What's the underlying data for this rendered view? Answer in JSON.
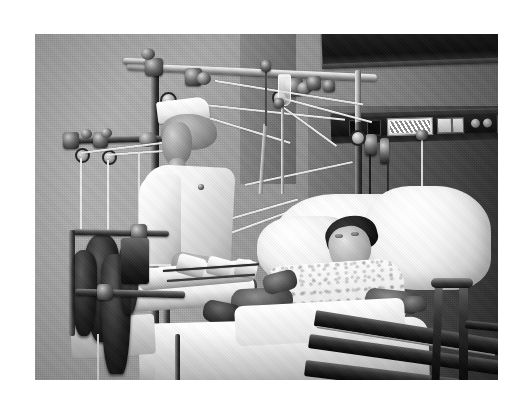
{
  "document": {
    "type": "photograph",
    "medium": "black-and-white photographic print",
    "page_background": "#ffffff",
    "caption": ""
  },
  "photo": {
    "title": "Nurse attending a patient in skeletal traction in a hospital room",
    "alt_text": "Black and white photograph of a nurse in white uniform and cap adjusting an overhead Balkan traction frame above a hospital bed where a male patient lies with both legs in casts and slings.",
    "frame": {
      "x": 35,
      "y": 34,
      "width": 463,
      "height": 346
    },
    "palette": {
      "wall_light": "#b4b4b4",
      "wall_mid": "#9b9b9b",
      "wall_dark": "#5e5e5e",
      "linen_white": "#ffffff",
      "metal_highlight": "#f3f3f3",
      "metal_shadow": "#1b1b1b",
      "deep_black": "#0a0a0a"
    }
  },
  "scene": {
    "setting_label": "hospital patient room",
    "subjects": [
      {
        "id": "nurse",
        "label": "nurse in white uniform",
        "position": "left of center, standing, bending over bed"
      },
      {
        "id": "patient",
        "label": "male patient lying supine in bed",
        "position": "right of center"
      }
    ],
    "objects": [
      {
        "id": "traction-frame",
        "label": "overhead Balkan traction frame"
      },
      {
        "id": "traction-ropes",
        "label": "traction ropes and pulleys"
      },
      {
        "id": "traction-weights",
        "label": "hanging traction weights"
      },
      {
        "id": "leg-casts",
        "label": "plaster leg casts and splints"
      },
      {
        "id": "iv-pole",
        "label": "intravenous pole with bottle"
      },
      {
        "id": "wall-panel",
        "label": "wall mounted medical gas and electrical outlet panel"
      },
      {
        "id": "bed-rail",
        "label": "hospital bed side rail and footboard"
      },
      {
        "id": "bed-linens",
        "label": "white bed sheets and pillow"
      },
      {
        "id": "nurse-cap",
        "label": "starched white nurse cap"
      },
      {
        "id": "valance",
        "label": "dark curtain track valance near ceiling"
      }
    ]
  }
}
